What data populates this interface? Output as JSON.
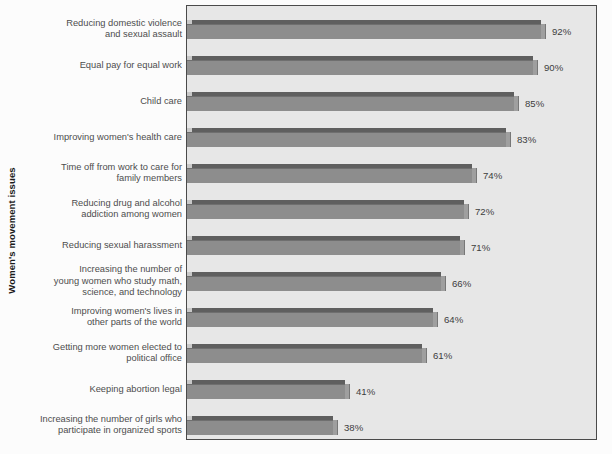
{
  "chart_data": {
    "type": "bar",
    "orientation": "horizontal",
    "title": "",
    "xlabel": "",
    "ylabel": "Women's movement issues",
    "xlim": [
      0,
      100
    ],
    "grid": false,
    "legend": null,
    "value_suffix": "%",
    "categories": [
      "Reducing domestic violence and sexual assault",
      "Equal pay for equal work",
      "Child care",
      "Improving women's health care",
      "Time off from work to care for family members",
      "Reducing drug and alcohol addiction among women",
      "Reducing sexual harassment",
      "Increasing the number of young women who study math, science, and technology",
      "Improving women's lives in other parts of the world",
      "Getting more women elected to political office",
      "Keeping abortion legal",
      "Increasing the number of girls who participate in organized sports"
    ],
    "category_lines": [
      [
        "Reducing domestic violence",
        "and sexual assault"
      ],
      [
        "Equal pay for equal work"
      ],
      [
        "Child care"
      ],
      [
        "Improving women's health care"
      ],
      [
        "Time off from work to care for",
        "family members"
      ],
      [
        "Reducing drug and alcohol",
        "addiction among women"
      ],
      [
        "Reducing sexual harassment"
      ],
      [
        "Increasing the number of",
        "young women who study math,",
        "science, and technology"
      ],
      [
        "Improving women's lives in",
        "other parts of the world"
      ],
      [
        "Getting more women elected to",
        "political office"
      ],
      [
        "Keeping abortion legal"
      ],
      [
        "Increasing the number of girls who",
        "participate in organized sports"
      ]
    ],
    "values": [
      92,
      90,
      85,
      83,
      74,
      72,
      71,
      66,
      64,
      61,
      41,
      38
    ],
    "value_labels": [
      "92%",
      "90%",
      "85%",
      "83%",
      "74%",
      "72%",
      "71%",
      "66%",
      "64%",
      "61%",
      "41%",
      "38%"
    ],
    "colors": {
      "bar_face": "#8d8d8d",
      "bar_top": "#5f5f5f",
      "bar_side": "#9f9f9f",
      "plot_background": "#e7e7e7",
      "plot_border": "#4a4a4a",
      "label_text": "#4d4d4d",
      "value_text": "#3d3d3d",
      "axis_title_text": "#1b1b1b",
      "page_background": "#fcfcfc"
    }
  }
}
